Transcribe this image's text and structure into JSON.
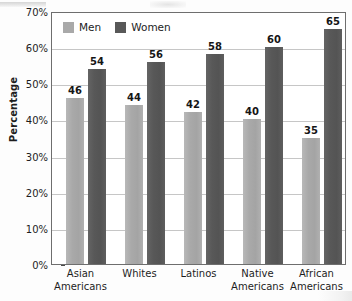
{
  "chart_data": {
    "type": "bar",
    "title": "",
    "subtitle": "",
    "xlabel": "",
    "ylabel": "Percentage",
    "ylim": [
      0,
      70
    ],
    "ytick_step": 10,
    "grid": true,
    "grid_axis": "y",
    "legend_position": "top-left-inside",
    "categories": [
      "Asian Americans",
      "Whites",
      "Latinos",
      "Native Americans",
      "African Americans"
    ],
    "category_lines": [
      [
        "Asian",
        "Americans"
      ],
      [
        "Whites"
      ],
      [
        "Latinos"
      ],
      [
        "Native",
        "Americans"
      ],
      [
        "African",
        "Americans"
      ]
    ],
    "series": [
      {
        "name": "Men",
        "values": [
          46,
          44,
          42,
          40,
          35
        ],
        "color": "#a9a9a9"
      },
      {
        "name": "Women",
        "values": [
          54,
          56,
          58,
          60,
          65
        ],
        "color": "#585858"
      }
    ],
    "ytick_labels": [
      "70%",
      "60%",
      "50%",
      "40%",
      "30%",
      "20%",
      "10%",
      "0%"
    ],
    "ytick_values": [
      70,
      60,
      50,
      40,
      30,
      20,
      10,
      0
    ],
    "value_label_format": "integer"
  },
  "legend": {
    "entries": [
      {
        "label": "Men",
        "swatch_color": "#a9a9a9"
      },
      {
        "label": "Women",
        "swatch_color": "#585858"
      }
    ]
  },
  "axes": {
    "y_title": "Percentage",
    "frame_color": "#6e6e6e",
    "gridline_color": "#c6c6c6",
    "tick_color": "#4a4a4a",
    "text_color": "#1d1d1d"
  }
}
